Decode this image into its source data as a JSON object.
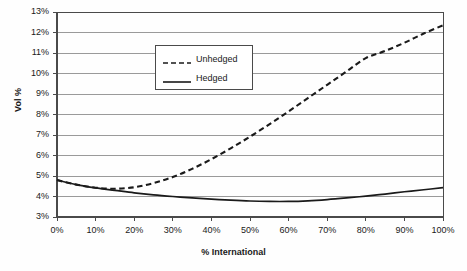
{
  "chart_data": {
    "type": "line",
    "title": "",
    "xlabel": "% International",
    "ylabel": "Vol %",
    "xlim": [
      0,
      100
    ],
    "ylim": [
      3,
      13
    ],
    "grid": true,
    "legend_position": "upper-left-inside",
    "xticks": [
      "0%",
      "10%",
      "20%",
      "30%",
      "40%",
      "50%",
      "60%",
      "70%",
      "80%",
      "90%",
      "100%"
    ],
    "yticks": [
      "3%",
      "4%",
      "5%",
      "6%",
      "7%",
      "8%",
      "9%",
      "10%",
      "11%",
      "12%",
      "13%"
    ],
    "x": [
      0,
      5,
      10,
      15,
      20,
      25,
      30,
      35,
      40,
      45,
      50,
      55,
      60,
      65,
      70,
      75,
      80,
      85,
      90,
      95,
      100
    ],
    "series": [
      {
        "name": "Unhedged",
        "style": "dashed",
        "color": "#1a1a1a",
        "values": [
          4.8,
          4.58,
          4.43,
          4.38,
          4.45,
          4.65,
          4.95,
          5.35,
          5.82,
          6.35,
          6.92,
          7.52,
          8.15,
          8.8,
          9.45,
          10.1,
          10.75,
          11.1,
          11.5,
          11.95,
          12.35
        ]
      },
      {
        "name": "Hedged",
        "style": "solid",
        "color": "#1a1a1a",
        "values": [
          4.8,
          4.58,
          4.42,
          4.3,
          4.18,
          4.08,
          4.0,
          3.93,
          3.87,
          3.82,
          3.78,
          3.76,
          3.76,
          3.79,
          3.85,
          3.93,
          4.02,
          4.12,
          4.23,
          4.33,
          4.43
        ]
      }
    ],
    "legend": [
      {
        "label": "Unhedged",
        "style": "dashed"
      },
      {
        "label": "Hedged",
        "style": "solid"
      }
    ]
  },
  "plot_geometry": {
    "left": 57,
    "right": 443,
    "top": 12,
    "bottom": 217
  },
  "colors": {
    "axis": "#4a4a4a",
    "grid": "#9a9a9a",
    "text": "#1a1a1a",
    "background": "#fefefe"
  }
}
